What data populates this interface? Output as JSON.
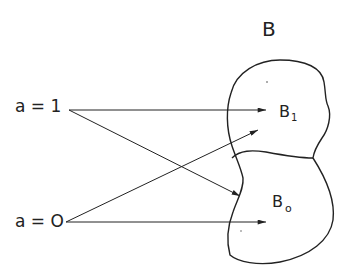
{
  "diagram": {
    "set_label": "B",
    "regions": [
      {
        "id": "B1",
        "label": "B",
        "subscript": "1"
      },
      {
        "id": "B0",
        "label": "B",
        "subscript": "o"
      }
    ],
    "inputs": [
      {
        "id": "a1",
        "label": "a = 1"
      },
      {
        "id": "a0",
        "label": "a = O"
      }
    ],
    "edges": [
      {
        "from": "a1",
        "to": "B1"
      },
      {
        "from": "a1",
        "to": "B0"
      },
      {
        "from": "a0",
        "to": "B1"
      },
      {
        "from": "a0",
        "to": "B0"
      }
    ],
    "colors": {
      "ink": "#222222",
      "background": "#ffffff"
    }
  }
}
